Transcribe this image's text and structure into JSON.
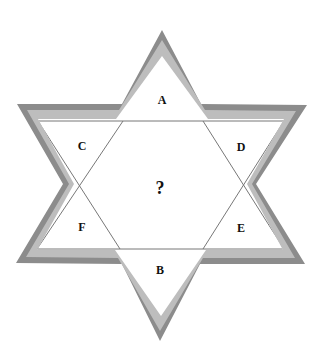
{
  "diagram": {
    "type": "six-pointed-star-puzzle",
    "regions": [
      {
        "id": "A",
        "label": "A",
        "x": 162,
        "y": 100
      },
      {
        "id": "B",
        "label": "B",
        "x": 160,
        "y": 270
      },
      {
        "id": "C",
        "label": "C",
        "x": 82,
        "y": 146
      },
      {
        "id": "D",
        "label": "D",
        "x": 241,
        "y": 147
      },
      {
        "id": "E",
        "label": "E",
        "x": 241,
        "y": 228
      },
      {
        "id": "F",
        "label": "F",
        "x": 82,
        "y": 227
      }
    ],
    "center": {
      "label": "?",
      "x": 160,
      "y": 188
    },
    "colors": {
      "outer_border": "#8c8c8c",
      "inner_border": "#bdbdbd",
      "fill": "#ffffff",
      "lines": "#777777",
      "text": "#111111"
    }
  }
}
